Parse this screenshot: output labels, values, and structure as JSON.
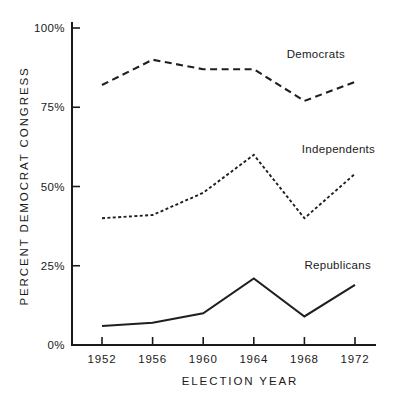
{
  "chart_data": {
    "type": "line",
    "title": "",
    "xlabel": "ELECTION YEAR",
    "ylabel": "PERCENT DEMOCRAT CONGRESS",
    "categories": [
      "1952",
      "1956",
      "1960",
      "1964",
      "1968",
      "1972"
    ],
    "x": [
      1952,
      1956,
      1960,
      1964,
      1968,
      1972
    ],
    "xlim": [
      1952,
      1972
    ],
    "ylim": [
      0,
      100
    ],
    "ytick_labels": [
      "100%",
      "75%",
      "50%",
      "25%",
      "0%"
    ],
    "ytick_values": [
      100,
      75,
      50,
      25,
      0
    ],
    "xtick_labels": [
      "1952",
      "1956",
      "1960",
      "1964",
      "1968",
      "1972"
    ],
    "grid": false,
    "legend_position": "inline-annotations",
    "series": [
      {
        "name": "Democrats",
        "style": "long-dashed",
        "color": "#1f1f1f",
        "values": [
          82,
          90,
          87,
          87,
          77,
          83
        ],
        "label_x": 1966.6,
        "label_y": 90.5
      },
      {
        "name": "Independents",
        "style": "fine-dashed",
        "color": "#1f1f1f",
        "values": [
          40,
          41,
          48,
          60,
          40,
          54
        ],
        "label_x": 1967.8,
        "label_y": 60.5
      },
      {
        "name": "Republicans",
        "style": "solid",
        "color": "#1f1f1f",
        "values": [
          6,
          7,
          10,
          21,
          9,
          19
        ],
        "label_x": 1968.0,
        "label_y": 24.0
      }
    ]
  },
  "axes": {
    "y_title": "PERCENT DEMOCRAT CONGRESS",
    "x_title": "ELECTION YEAR",
    "y_ticks": [
      {
        "label": "100%",
        "value": 100
      },
      {
        "label": "75%",
        "value": 75
      },
      {
        "label": "50%",
        "value": 50
      },
      {
        "label": "25%",
        "value": 25
      },
      {
        "label": "0%",
        "value": 0
      }
    ],
    "x_ticks": [
      {
        "label": "1952",
        "value": 1952
      },
      {
        "label": "1956",
        "value": 1956
      },
      {
        "label": "1960",
        "value": 1960
      },
      {
        "label": "1964",
        "value": 1964
      },
      {
        "label": "1968",
        "value": 1968
      },
      {
        "label": "1972",
        "value": 1972
      }
    ]
  },
  "colors": {
    "ink": "#1a1a1a",
    "series_ink": "#1f1f1f",
    "background": "#ffffff"
  }
}
